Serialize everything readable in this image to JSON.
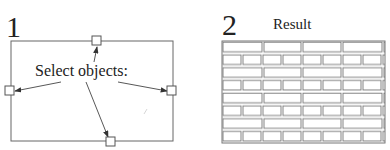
{
  "panels": [
    {
      "step_number": "1",
      "callout_text": "Select objects:",
      "boundary": {
        "x": 11,
        "y": 41,
        "width": 162,
        "height": 100
      },
      "grips": [
        {
          "name": "top",
          "x": 97,
          "y": 41
        },
        {
          "name": "left",
          "x": 10,
          "y": 90
        },
        {
          "name": "right",
          "x": 172,
          "y": 91
        },
        {
          "name": "bottom",
          "x": 110,
          "y": 141
        }
      ]
    },
    {
      "step_number": "2",
      "title": "Result",
      "hatch": {
        "pattern": "brick",
        "x": 222,
        "y": 41,
        "width": 163,
        "height": 102,
        "rows": 8
      }
    }
  ],
  "colors": {
    "stroke": "#555555",
    "text": "#222222",
    "hatch": "#777777"
  }
}
